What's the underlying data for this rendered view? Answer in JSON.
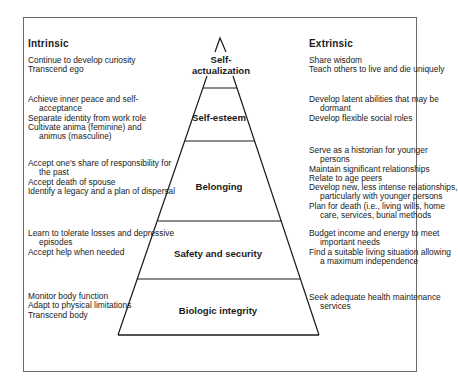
{
  "diagram": {
    "type": "pyramid",
    "columns": {
      "left_heading": "Intrinsic",
      "right_heading": "Extrinsic"
    },
    "tiers": [
      {
        "label_lines": [
          "Self-",
          "actualization"
        ],
        "intrinsic": [
          {
            "text": "Continue to develop curiosity",
            "indent": false
          },
          {
            "text": "Transcend ego",
            "indent": false
          }
        ],
        "extrinsic": [
          {
            "text": "Share wisdom",
            "indent": false
          },
          {
            "text": "Teach others to live and die uniquely",
            "indent": false
          }
        ]
      },
      {
        "label_lines": [
          "Self-esteem"
        ],
        "intrinsic": [
          {
            "text": "Achieve inner peace and self-",
            "indent": false
          },
          {
            "text": "acceptance",
            "indent": true
          },
          {
            "text": "Separate identity from work role",
            "indent": false
          },
          {
            "text": "Cultivate anima (feminine) and",
            "indent": false
          },
          {
            "text": "animus (masculine)",
            "indent": true
          }
        ],
        "extrinsic": [
          {
            "text": "Develop latent abilities that may be",
            "indent": false
          },
          {
            "text": "dormant",
            "indent": true
          },
          {
            "text": "Develop flexible social roles",
            "indent": false
          }
        ]
      },
      {
        "label_lines": [
          "Belonging"
        ],
        "intrinsic": [
          {
            "text": "Accept one's share of responsibility for",
            "indent": false
          },
          {
            "text": "the past",
            "indent": true
          },
          {
            "text": "Accept death of spouse",
            "indent": false
          },
          {
            "text": "Identify a legacy and a plan of dispersal",
            "indent": false
          }
        ],
        "extrinsic": [
          {
            "text": "Serve as a historian for younger",
            "indent": false
          },
          {
            "text": "persons",
            "indent": true
          },
          {
            "text": "Maintain significant relationships",
            "indent": false
          },
          {
            "text": "Relate to age peers",
            "indent": false
          },
          {
            "text": "Develop new, less intense relationships,",
            "indent": false
          },
          {
            "text": "particularly with younger persons",
            "indent": true
          },
          {
            "text": "Plan for death (i.e., living wills, home",
            "indent": false
          },
          {
            "text": "care, services, burial methods",
            "indent": true
          }
        ]
      },
      {
        "label_lines": [
          "Safety and security"
        ],
        "intrinsic": [
          {
            "text": "Learn to tolerate losses and depressive",
            "indent": false
          },
          {
            "text": "episodes",
            "indent": true
          },
          {
            "text": "Accept help when needed",
            "indent": false
          }
        ],
        "extrinsic": [
          {
            "text": "Budget income and energy to meet",
            "indent": false
          },
          {
            "text": "important needs",
            "indent": true
          },
          {
            "text": "Find a suitable living situation allowing",
            "indent": false
          },
          {
            "text": "a maximum independence",
            "indent": true
          }
        ]
      },
      {
        "label_lines": [
          "Biologic integrity"
        ],
        "intrinsic": [
          {
            "text": "Monitor body function",
            "indent": false
          },
          {
            "text": "Adapt to physical limitations",
            "indent": false
          },
          {
            "text": "Transcend body",
            "indent": false
          }
        ],
        "extrinsic": [
          {
            "text": "Seek adequate health maintenance",
            "indent": false
          },
          {
            "text": "services",
            "indent": true
          }
        ]
      }
    ]
  }
}
